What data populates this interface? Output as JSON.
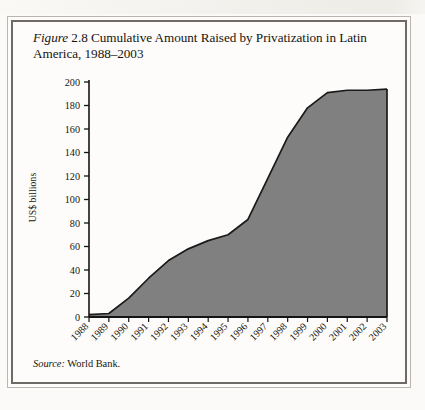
{
  "figure": {
    "caption_label": "Figure",
    "caption_number": "2.8",
    "caption_text": "Cumulative Amount Raised by Privatization in Latin America, 1988–2003",
    "source_label": "Source:",
    "source_text": "World Bank."
  },
  "chart_data": {
    "type": "area",
    "xlabel": "",
    "ylabel": "US$ billions",
    "categories": [
      "1988",
      "1989",
      "1990",
      "1991",
      "1992",
      "1993",
      "1994",
      "1995",
      "1996",
      "1997",
      "1998",
      "1999",
      "2000",
      "2001",
      "2002",
      "2003"
    ],
    "values": [
      2,
      3,
      16,
      33,
      48,
      58,
      65,
      70,
      83,
      118,
      153,
      178,
      191,
      193,
      193,
      194
    ],
    "series": [
      {
        "name": "Cumulative amount raised",
        "values": [
          2,
          3,
          16,
          33,
          48,
          58,
          65,
          70,
          83,
          118,
          153,
          178,
          191,
          193,
          193,
          194
        ]
      }
    ],
    "ylim": [
      0,
      200
    ],
    "ytick_values": [
      0,
      20,
      40,
      60,
      80,
      100,
      120,
      140,
      160,
      180,
      200
    ],
    "ytick_labels": [
      "0",
      "20",
      "40",
      "60",
      "80",
      "100",
      "120",
      "140",
      "160",
      "180",
      "200"
    ],
    "xtick_labels": [
      "1988",
      "1989",
      "1990",
      "1991",
      "1992",
      "1993",
      "1994",
      "1995",
      "1996",
      "1997",
      "1998",
      "1999",
      "2000",
      "2001",
      "2002",
      "2003"
    ],
    "xtick_rotation": "45",
    "grid": "off",
    "legend": "none",
    "fill_color": "#808080",
    "line_color": "#1a1a1a",
    "axis_color": "#141414"
  }
}
